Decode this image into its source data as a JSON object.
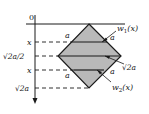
{
  "diagram": {
    "axis": {
      "origin_label": "0",
      "ticks": [
        {
          "label": "x",
          "y": 42
        },
        {
          "label": "√2a/2",
          "y": 56
        },
        {
          "label": "x",
          "y": 70
        },
        {
          "label": "√2a",
          "y": 88
        }
      ]
    },
    "shape": {
      "name": "square rotated 45° (diamond)",
      "fill": "#b9b9b9",
      "stroke": "#1a1a1a",
      "vertices": {
        "top": [
          89,
          24
        ],
        "left": [
          58,
          56
        ],
        "right": [
          121,
          56
        ],
        "bottom": [
          89,
          88
        ]
      }
    },
    "labels": {
      "side_upper_left": "a",
      "side_upper_right": "a",
      "side_lower_left": "a",
      "side_lower_right": "a",
      "diagonal": "√2a",
      "w1": "w",
      "w1_sub": "1",
      "w1_arg": "(x)",
      "w2": "w",
      "w2_sub": "2",
      "w2_arg": "(x)"
    }
  }
}
